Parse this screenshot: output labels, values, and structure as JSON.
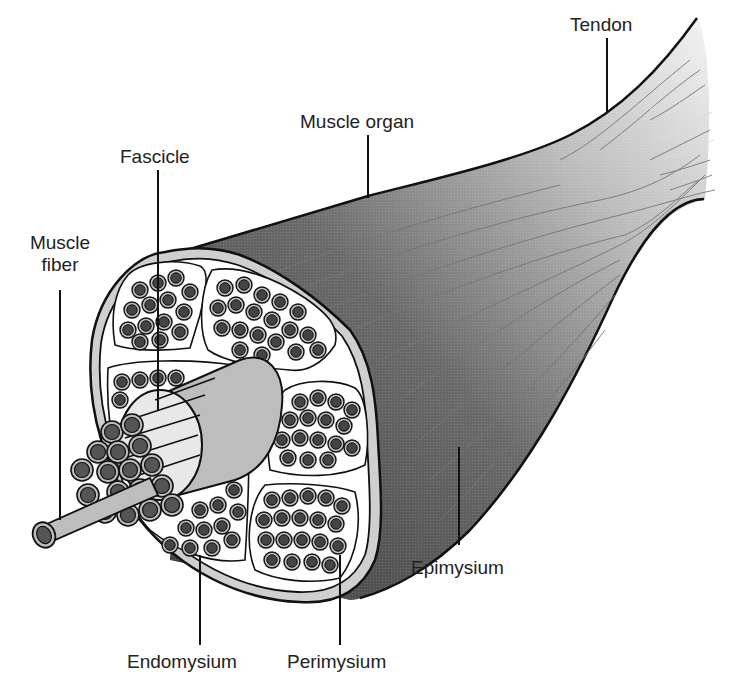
{
  "diagram": {
    "labels": {
      "tendon": "Tendon",
      "muscle_organ": "Muscle organ",
      "fascicle": "Fascicle",
      "muscle_fiber_line1": "Muscle",
      "muscle_fiber_line2": "fiber",
      "epimysium": "Epimysium",
      "endomysium": "Endomysium",
      "perimysium": "Perimysium"
    },
    "colors": {
      "muscle_dark": "#4a4a4a",
      "tendon_light": "#f2f2f2",
      "sheath": "#cfcfcf",
      "fiber_core": "#555555",
      "fiber_ring": "#bdbdbd",
      "outline": "#111111"
    }
  }
}
